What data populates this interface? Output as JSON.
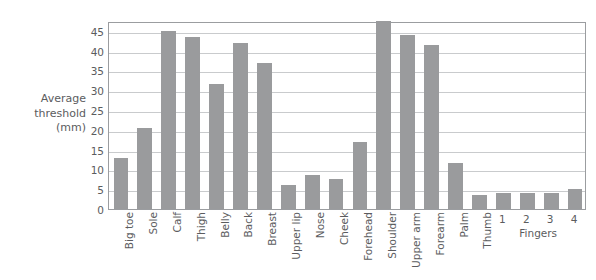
{
  "chart_data": {
    "type": "bar",
    "title": "",
    "xlabel": "",
    "ylabel": "Average\nthreshold\n(mm)",
    "ylim": [
      0,
      47.5
    ],
    "yticks": [
      0,
      5,
      10,
      15,
      20,
      25,
      30,
      35,
      40,
      45
    ],
    "grid": true,
    "legend": "none",
    "bar_color": "#9a9b9d",
    "categories": [
      "Big toe",
      "Sole",
      "Calf",
      "Thigh",
      "Belly",
      "Back",
      "Breast",
      "Upper lip",
      "Nose",
      "Cheek",
      "Forehead",
      "Shoulder",
      "Upper arm",
      "Forearm",
      "Palm",
      "Thumb",
      "1",
      "2",
      "3",
      "4"
    ],
    "values": [
      13,
      20.5,
      45,
      43.5,
      31.5,
      42,
      37,
      6,
      8.5,
      7.5,
      17,
      47.5,
      44,
      41.5,
      11.5,
      3.5,
      4,
      4,
      4,
      5
    ],
    "group_labels": [
      {
        "label": "Fingers",
        "spans": [
          "1",
          "2",
          "3",
          "4"
        ]
      }
    ]
  }
}
